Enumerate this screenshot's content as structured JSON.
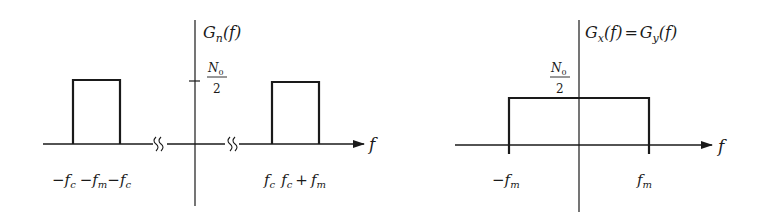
{
  "left_plot": {
    "y_label": {
      "G": "G",
      "sub": "n",
      "arg": "(f)"
    },
    "level_label": {
      "num": "N",
      "num_sub": "0",
      "den": "2"
    },
    "x_axis_label": "f",
    "neg_band_labels": {
      "a": "−f",
      "a_sub": "c",
      "b": "−f",
      "b_sub": "m",
      "c": "−f",
      "c_sub": "c"
    },
    "pos_band_labels": {
      "a": "f",
      "a_sub": "c",
      "b": "f",
      "b_sub": "c",
      "plus": "+",
      "c": "f",
      "c_sub": "m"
    }
  },
  "right_plot": {
    "y_label": {
      "G1": "G",
      "sub1": "x",
      "arg1": "(f)",
      "eq": "=",
      "G2": "G",
      "sub2": "y",
      "arg2": "(f)"
    },
    "level_label": {
      "num": "N",
      "num_sub": "0",
      "den": "2"
    },
    "x_axis_label": "f",
    "tick_labels": {
      "neg": "−f",
      "neg_sub": "m",
      "pos": "f",
      "pos_sub": "m"
    }
  },
  "colors": {
    "ink": "#1a1a1a",
    "background": "#ffffff"
  }
}
